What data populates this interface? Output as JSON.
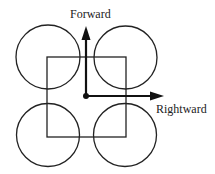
{
  "diagram": {
    "labels": {
      "forward": "Forward",
      "rightward": "Rightward"
    },
    "colors": {
      "stroke": "#222222",
      "background": "#ffffff"
    },
    "elements": {
      "square": {
        "x": 47,
        "y": 57,
        "width": 79,
        "height": 80
      },
      "circles": [
        {
          "position": "top-left",
          "cx": 48,
          "cy": 57,
          "r": 32
        },
        {
          "position": "top-right",
          "cx": 125.5,
          "cy": 57.5,
          "r": 31.5
        },
        {
          "position": "bottom-left",
          "cx": 48,
          "cy": 135,
          "r": 31.5
        },
        {
          "position": "bottom-right",
          "cx": 125,
          "cy": 135,
          "r": 31.5
        }
      ],
      "origin": {
        "x": 86,
        "y": 96
      },
      "forward_arrow": {
        "x1": 86,
        "y1": 96,
        "x2": 86,
        "y2": 27
      },
      "rightward_arrow": {
        "x1": 86,
        "y1": 96,
        "x2": 163,
        "y2": 96
      }
    }
  }
}
